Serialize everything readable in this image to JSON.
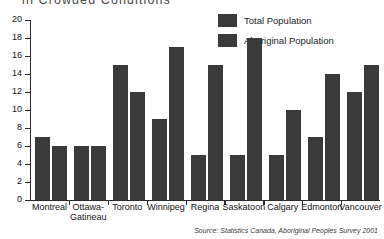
{
  "chart_data": {
    "type": "bar",
    "title": "in Crowded Conditions",
    "xlabel": "",
    "ylabel": "",
    "ylim": [
      0,
      20
    ],
    "ytick_step": 2,
    "yticks": [
      "0",
      "2",
      "4",
      "6",
      "8",
      "10",
      "12",
      "14",
      "16",
      "18",
      "20"
    ],
    "grid": false,
    "legend_position": "top-right",
    "categories": [
      "Montreal",
      "Ottawa-Gatineau",
      "Toronto",
      "Winnipeg",
      "Regina",
      "Saskatoon",
      "Calgary",
      "Edmonton",
      "Vancouver"
    ],
    "series": [
      {
        "name": "Total Population",
        "color": "#3a3a3a",
        "values": [
          7,
          6,
          15,
          9,
          5,
          5,
          5,
          7,
          12
        ]
      },
      {
        "name": "Aboriginal Population",
        "color": "#3a3a3a",
        "values": [
          6,
          6,
          12,
          17,
          15,
          18,
          10,
          14,
          15
        ]
      }
    ],
    "source": "Source: Statistics Canada, Aboriginal Peoples Survey 2001"
  },
  "legend": {
    "items": [
      {
        "label": "Total Population"
      },
      {
        "label": "Aboriginal Population"
      }
    ]
  },
  "colors": {
    "bar": "#3a3a3a",
    "axis": "#2b2b2b",
    "background": "#ffffff",
    "title": "#4a4a4a"
  }
}
